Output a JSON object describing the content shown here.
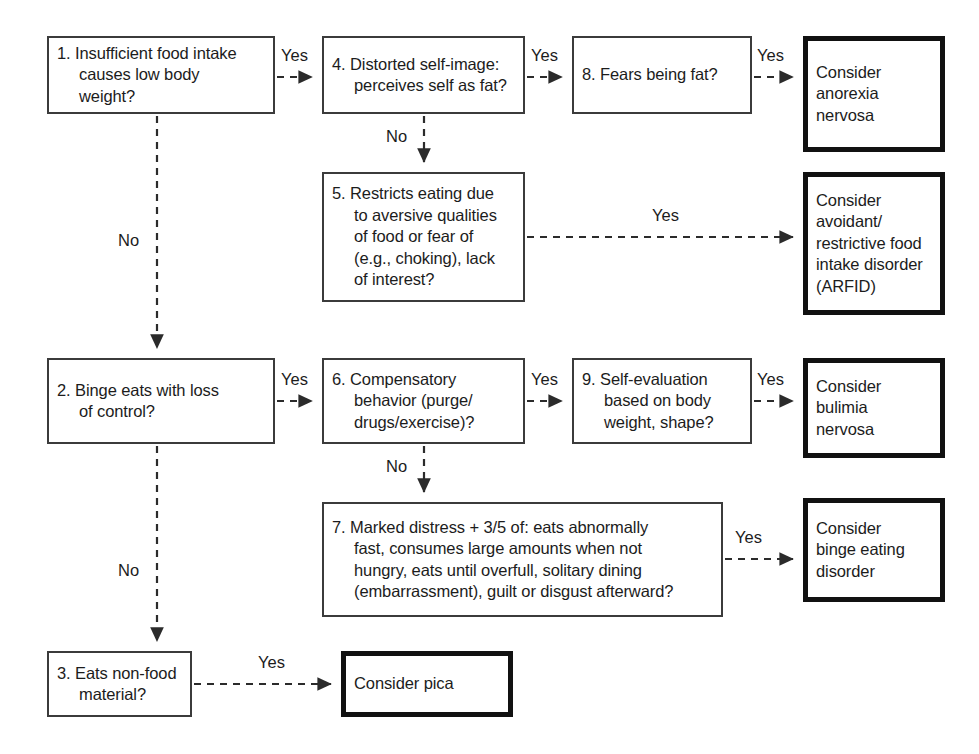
{
  "diagram": {
    "colors": {
      "question_border": "#3b3b3b",
      "outcome_border": "#111111",
      "edge": "#2b2b2b",
      "background": "#ffffff",
      "text": "#1c1c1c"
    },
    "nodes": [
      {
        "id": "q1",
        "kind": "question",
        "number": "1.",
        "text": "1. Insufficient food intake\ncauses low body\nweight?",
        "x": 47,
        "y": 36,
        "w": 228,
        "h": 78
      },
      {
        "id": "q4",
        "kind": "question",
        "number": "4.",
        "text": "4. Distorted self-image:\nperceives self as fat?",
        "x": 322,
        "y": 36,
        "w": 203,
        "h": 78
      },
      {
        "id": "q8",
        "kind": "question",
        "number": "8.",
        "text": "8. Fears being fat?",
        "x": 572,
        "y": 36,
        "w": 180,
        "h": 78
      },
      {
        "id": "o-anorexia",
        "kind": "outcome",
        "text": "Consider\nanorexia\nnervosa",
        "x": 803,
        "y": 36,
        "w": 142,
        "h": 116
      },
      {
        "id": "q5",
        "kind": "question",
        "number": "5.",
        "text": "5. Restricts eating due\nto aversive qualities\nof food or fear of\n(e.g., choking), lack\nof interest?",
        "x": 322,
        "y": 172,
        "w": 203,
        "h": 130
      },
      {
        "id": "o-arfid",
        "kind": "outcome",
        "text": "Consider\navoidant/\nrestrictive food\nintake disorder\n(ARFID)",
        "x": 803,
        "y": 172,
        "w": 142,
        "h": 143
      },
      {
        "id": "q2",
        "kind": "question",
        "number": "2.",
        "text": "2. Binge eats with loss\nof control?",
        "x": 47,
        "y": 358,
        "w": 228,
        "h": 86
      },
      {
        "id": "q6",
        "kind": "question",
        "number": "6.",
        "text": "6. Compensatory\nbehavior (purge/\ndrugs/exercise)?",
        "x": 322,
        "y": 358,
        "w": 203,
        "h": 86
      },
      {
        "id": "q9",
        "kind": "question",
        "number": "9.",
        "text": "9. Self-evaluation\nbased on body\nweight, shape?",
        "x": 572,
        "y": 358,
        "w": 180,
        "h": 86
      },
      {
        "id": "o-bulimia",
        "kind": "outcome",
        "text": "Consider\nbulimia\nnervosa",
        "x": 803,
        "y": 358,
        "w": 142,
        "h": 100
      },
      {
        "id": "q7",
        "kind": "question",
        "number": "7.",
        "text": "7. Marked distress + 3/5 of: eats abnormally\nfast, consumes large amounts when not\nhungry, eats until overfull, solitary dining\n(embarrassment), guilt or disgust afterward?",
        "x": 322,
        "y": 502,
        "w": 401,
        "h": 115
      },
      {
        "id": "o-bed",
        "kind": "outcome",
        "text": "Consider\nbinge eating\ndisorder",
        "x": 803,
        "y": 498,
        "w": 142,
        "h": 104
      },
      {
        "id": "q3",
        "kind": "question",
        "number": "3.",
        "text": "3. Eats non-food\nmaterial?",
        "x": 47,
        "y": 651,
        "w": 145,
        "h": 66
      },
      {
        "id": "o-pica",
        "kind": "outcome",
        "text": "Consider pica",
        "x": 341,
        "y": 651,
        "w": 172,
        "h": 66
      }
    ],
    "edges": [
      {
        "id": "e-q1-q4",
        "label": "Yes",
        "from": "q1",
        "to": "q4",
        "path": "M 277 77 L 312 77",
        "label_x": 281,
        "label_y": 47
      },
      {
        "id": "e-q4-q8",
        "label": "Yes",
        "from": "q4",
        "to": "q8",
        "path": "M 527 77 L 562 77",
        "label_x": 531,
        "label_y": 47
      },
      {
        "id": "e-q8-anorexia",
        "label": "Yes",
        "from": "q8",
        "to": "o-anorexia",
        "path": "M 754 77 L 793 77",
        "label_x": 757,
        "label_y": 47
      },
      {
        "id": "e-q4-q5",
        "label": "No",
        "from": "q4",
        "to": "q5",
        "path": "M 424 116 L 424 162",
        "label_x": 386,
        "label_y": 128
      },
      {
        "id": "e-q5-arfid",
        "label": "Yes",
        "from": "q5",
        "to": "o-arfid",
        "path": "M 527 237 L 793 237",
        "label_x": 652,
        "label_y": 207
      },
      {
        "id": "e-q1-q2",
        "label": "No",
        "from": "q1",
        "to": "q2",
        "path": "M 157 116 L 157 348",
        "label_x": 118,
        "label_y": 232
      },
      {
        "id": "e-q2-q6",
        "label": "Yes",
        "from": "q2",
        "to": "q6",
        "path": "M 277 401 L 312 401",
        "label_x": 281,
        "label_y": 371
      },
      {
        "id": "e-q6-q9",
        "label": "Yes",
        "from": "q6",
        "to": "q9",
        "path": "M 527 401 L 562 401",
        "label_x": 531,
        "label_y": 371
      },
      {
        "id": "e-q9-bulimia",
        "label": "Yes",
        "from": "q9",
        "to": "o-bulimia",
        "path": "M 754 401 L 793 401",
        "label_x": 757,
        "label_y": 371
      },
      {
        "id": "e-q6-q7",
        "label": "No",
        "from": "q6",
        "to": "q7",
        "path": "M 424 446 L 424 492",
        "label_x": 386,
        "label_y": 458
      },
      {
        "id": "e-q7-bed",
        "label": "Yes",
        "from": "q7",
        "to": "o-bed",
        "path": "M 725 559 L 793 559",
        "label_x": 735,
        "label_y": 529
      },
      {
        "id": "e-q2-q3",
        "label": "No",
        "from": "q2",
        "to": "q3",
        "path": "M 157 446 L 157 641",
        "label_x": 118,
        "label_y": 562
      },
      {
        "id": "e-q3-pica",
        "label": "Yes",
        "from": "q3",
        "to": "o-pica",
        "path": "M 194 684 L 331 684",
        "label_x": 258,
        "label_y": 654
      }
    ]
  }
}
